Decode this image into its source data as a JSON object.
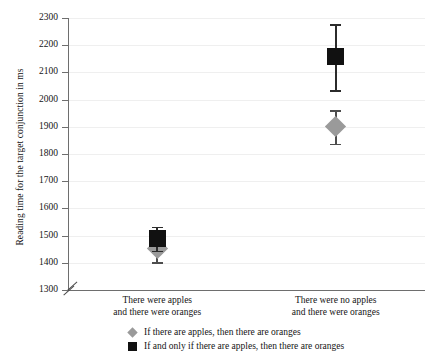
{
  "chart_data": {
    "type": "scatter",
    "title": "",
    "xlabel": "",
    "ylabel": "Reading time for the target conjunction in ms",
    "ylim": [
      1300,
      2300
    ],
    "ytick_step": 100,
    "yticks": [
      2300,
      2200,
      2100,
      2000,
      1900,
      1800,
      1700,
      1600,
      1500,
      1400,
      1300
    ],
    "axis_break": true,
    "grid": true,
    "legend_position": "bottom",
    "categories": [
      "There were apples\nand there were oranges",
      "There were no apples\nand there were oranges"
    ],
    "category_lines": [
      [
        "There were apples",
        "and there were oranges"
      ],
      [
        "There were no apples",
        "and there were oranges"
      ]
    ],
    "series": [
      {
        "name": "If there are apples, then there are oranges",
        "marker": "diamond",
        "color": "#9a9a9a",
        "values": [
          1452,
          1900
        ],
        "err_low": [
          1402,
          1838
        ],
        "err_high": [
          1505,
          1960
        ]
      },
      {
        "name": "If and only if there are apples, then there are oranges",
        "marker": "square",
        "color": "#111111",
        "values": [
          1490,
          2160
        ],
        "err_low": [
          1445,
          2035
        ],
        "err_high": [
          1532,
          2278
        ]
      }
    ]
  },
  "legend": {
    "items": [
      {
        "label": "If there are apples, then there are oranges",
        "marker": "diamond"
      },
      {
        "label": "If and only if there are apples, then there are oranges",
        "marker": "square"
      }
    ]
  },
  "axis": {
    "ytick_labels": [
      "2300",
      "2200",
      "2100",
      "2000",
      "1900",
      "1800",
      "1700",
      "1600",
      "1500",
      "1400",
      "1300"
    ]
  }
}
